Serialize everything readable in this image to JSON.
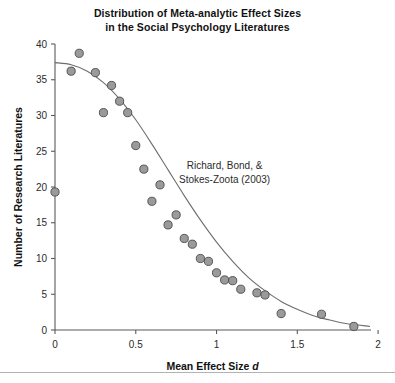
{
  "chart_data": {
    "type": "scatter",
    "title": "Distribution of Meta-analytic Effect Sizes in the Social Psychology Literatures",
    "title_lines": [
      "Distribution of Meta-analytic Effect Sizes",
      "in the Social Psychology Literatures"
    ],
    "xlabel_plain": "Mean Effect Size d",
    "xlabel_prefix": "Mean Effect Size ",
    "xlabel_italic": "d",
    "ylabel": "Number of Research Literatures",
    "xlim": [
      0,
      1.95
    ],
    "ylim": [
      0,
      40
    ],
    "xticks": [
      0,
      0.5,
      1,
      1.5,
      2
    ],
    "xticklabels": [
      "0",
      "0.5",
      "1",
      "1.5",
      "2"
    ],
    "yticks": [
      0,
      5,
      10,
      15,
      20,
      25,
      30,
      35,
      40
    ],
    "yticklabels": [
      "0",
      "5",
      "10",
      "15",
      "20",
      "25",
      "30",
      "35",
      "40"
    ],
    "grid": false,
    "legend": "none",
    "annotation_lines": [
      "Richard, Bond, &",
      "Stokes-Zoota (2003)"
    ],
    "annotation_x": 1.05,
    "annotation_y": 22.5,
    "marker_color": "#9a9a9a",
    "marker_edge_color": "#4a4a4a",
    "curve_color": "#6e6e6e",
    "axis_color": "#5a5a5a",
    "x": [
      0.0,
      0.1,
      0.15,
      0.25,
      0.3,
      0.35,
      0.4,
      0.45,
      0.5,
      0.55,
      0.6,
      0.65,
      0.7,
      0.75,
      0.8,
      0.85,
      0.9,
      0.95,
      1.0,
      1.05,
      1.1,
      1.15,
      1.25,
      1.3,
      1.4,
      1.65,
      1.85
    ],
    "y": [
      19.3,
      36.2,
      38.7,
      36.0,
      30.4,
      34.2,
      32.0,
      30.4,
      25.8,
      22.5,
      18.0,
      20.3,
      14.7,
      16.1,
      12.8,
      12.0,
      10.0,
      9.6,
      8.0,
      7.0,
      6.9,
      5.7,
      5.2,
      4.9,
      2.3,
      2.2,
      0.5
    ],
    "curve_points": [
      [
        0.0,
        37.4
      ],
      [
        0.1,
        37.1
      ],
      [
        0.2,
        36.2
      ],
      [
        0.3,
        34.6
      ],
      [
        0.4,
        32.3
      ],
      [
        0.5,
        29.4
      ],
      [
        0.6,
        26.0
      ],
      [
        0.7,
        22.4
      ],
      [
        0.8,
        18.8
      ],
      [
        0.9,
        15.4
      ],
      [
        1.0,
        12.3
      ],
      [
        1.1,
        9.6
      ],
      [
        1.2,
        7.3
      ],
      [
        1.3,
        5.5
      ],
      [
        1.4,
        4.0
      ],
      [
        1.5,
        2.9
      ],
      [
        1.6,
        2.0
      ],
      [
        1.7,
        1.4
      ],
      [
        1.8,
        0.9
      ],
      [
        1.95,
        0.5
      ]
    ],
    "points": [
      {
        "x": 0.0,
        "y": 19.3
      },
      {
        "x": 0.1,
        "y": 36.2
      },
      {
        "x": 0.15,
        "y": 38.7
      },
      {
        "x": 0.25,
        "y": 36.0
      },
      {
        "x": 0.3,
        "y": 30.4
      },
      {
        "x": 0.35,
        "y": 34.2
      },
      {
        "x": 0.4,
        "y": 32.0
      },
      {
        "x": 0.45,
        "y": 30.4
      },
      {
        "x": 0.5,
        "y": 25.8
      },
      {
        "x": 0.55,
        "y": 22.5
      },
      {
        "x": 0.6,
        "y": 18.0
      },
      {
        "x": 0.65,
        "y": 20.3
      },
      {
        "x": 0.7,
        "y": 14.7
      },
      {
        "x": 0.75,
        "y": 16.1
      },
      {
        "x": 0.8,
        "y": 12.8
      },
      {
        "x": 0.85,
        "y": 12.0
      },
      {
        "x": 0.9,
        "y": 10.0
      },
      {
        "x": 0.95,
        "y": 9.6
      },
      {
        "x": 1.0,
        "y": 8.0
      },
      {
        "x": 1.05,
        "y": 7.0
      },
      {
        "x": 1.1,
        "y": 6.9
      },
      {
        "x": 1.15,
        "y": 5.7
      },
      {
        "x": 1.25,
        "y": 5.2
      },
      {
        "x": 1.3,
        "y": 4.9
      },
      {
        "x": 1.4,
        "y": 2.3
      },
      {
        "x": 1.65,
        "y": 2.2
      },
      {
        "x": 1.85,
        "y": 0.5
      }
    ]
  }
}
